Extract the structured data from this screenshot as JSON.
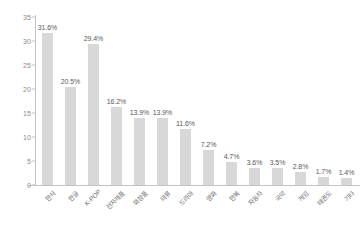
{
  "chart_data": {
    "type": "bar",
    "title": "",
    "subtitle": "",
    "xlabel": "",
    "ylabel": "",
    "ylim": [
      0,
      35
    ],
    "ytick_labels": [
      "0",
      "5",
      "10",
      "15",
      "20",
      "25",
      "30",
      "35"
    ],
    "ytick_values": [
      0,
      5,
      10,
      15,
      20,
      25,
      30,
      35
    ],
    "grid": false,
    "legend": false,
    "legend_position": "none",
    "bar_color": "#d8d8d8",
    "value_suffix": "%",
    "categories": [
      "한식",
      "한글",
      "K-POP",
      "전자제품",
      "화장품",
      "의류",
      "드라마",
      "영화",
      "한복",
      "자동차",
      "국악",
      "게임",
      "태권도",
      "기타"
    ],
    "values": [
      31.6,
      20.5,
      29.4,
      16.2,
      13.9,
      13.9,
      11.6,
      7.2,
      4.7,
      3.6,
      3.5,
      2.8,
      1.7,
      1.4
    ],
    "data_labels": [
      "31.6%",
      "20.5%",
      "29.4%",
      "16.2%",
      "13.9%",
      "13.9%",
      "11.6%",
      "7.2%",
      "4.7%",
      "3.6%",
      "3.5%",
      "2.8%",
      "1.7%",
      "1.4%"
    ]
  }
}
